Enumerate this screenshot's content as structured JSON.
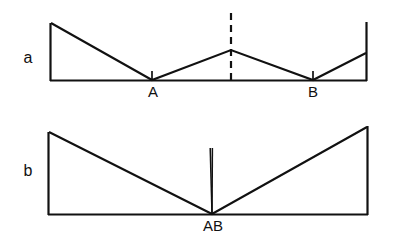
{
  "figure": {
    "caption": "",
    "background_color": "#ffffff",
    "line_color": "#111111",
    "width": 395,
    "height": 245
  },
  "panels": [
    {
      "id": "panel-a",
      "label": "a",
      "label_x": 28,
      "label_y": 63,
      "baseline": {
        "x1": 50,
        "y1": 80.5,
        "x2": 367,
        "y2": 80.5
      },
      "left_wall": {
        "x1": 50.5,
        "y1": 23,
        "x2": 50.5,
        "y2": 81
      },
      "right_wall": {
        "x1": 366.5,
        "y1": 22,
        "x2": 366.5,
        "y2": 81
      },
      "profile_points": "51,23 152,80 231,50 313,80 366,53",
      "dashed_marker": {
        "x": 231,
        "y_top": 13,
        "y_bottom": 81
      },
      "ticks": [
        {
          "x": 152,
          "y_top": 71,
          "y_bottom": 80
        },
        {
          "x": 313,
          "y_top": 71,
          "y_bottom": 80
        }
      ],
      "point_labels": [
        {
          "text": "A",
          "x": 153,
          "y": 97
        },
        {
          "text": "B",
          "x": 313,
          "y": 97
        }
      ]
    },
    {
      "id": "panel-b",
      "label": "b",
      "label_x": 28,
      "label_y": 176,
      "baseline": {
        "x1": 48,
        "y1": 214.5,
        "x2": 368,
        "y2": 214.5
      },
      "left_wall": {
        "x1": 48.5,
        "y1": 132,
        "x2": 48.5,
        "y2": 215
      },
      "right_wall": {
        "x1": 367.5,
        "y1": 126,
        "x2": 367.5,
        "y2": 215
      },
      "profile_points": "49,132 212,214 367,127",
      "spike": {
        "apex_x": 212,
        "base_y": 214,
        "top_y": 148,
        "left_top_x": 210.2,
        "right_top_x": 212.4
      },
      "point_labels": [
        {
          "text": "AB",
          "x": 213,
          "y": 231
        }
      ]
    }
  ]
}
